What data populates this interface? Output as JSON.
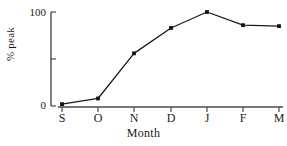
{
  "chart_data": {
    "type": "line",
    "title": "",
    "subtitle": "",
    "xlabel": "Month",
    "ylabel": "% peak",
    "categories": [
      "S",
      "O",
      "N",
      "D",
      "J",
      "F",
      "M"
    ],
    "values": [
      2,
      8,
      56,
      83,
      100,
      86,
      85
    ],
    "series": [
      {
        "name": "% peak",
        "values": [
          2,
          8,
          56,
          83,
          100,
          86,
          85
        ]
      }
    ],
    "ylim": [
      0,
      100
    ],
    "ytick_values": [
      0,
      50,
      100
    ],
    "ytick_labels": [
      "0",
      "",
      "100"
    ],
    "xtick_labels": [
      "S",
      "O",
      "N",
      "D",
      "J",
      "F",
      "M"
    ],
    "grid": false,
    "legend": false,
    "legend_position": "none",
    "marker": "filled-square",
    "line_color": "#1a1a1a",
    "axis_color": "#4a4a4a",
    "background_color": "#ffffff",
    "annotations": []
  },
  "axes": {
    "y_label_text": "% peak",
    "x_label_text": "Month",
    "y_tick_top_label": "100",
    "y_tick_mid_label": "",
    "y_tick_bottom_label": "0"
  }
}
